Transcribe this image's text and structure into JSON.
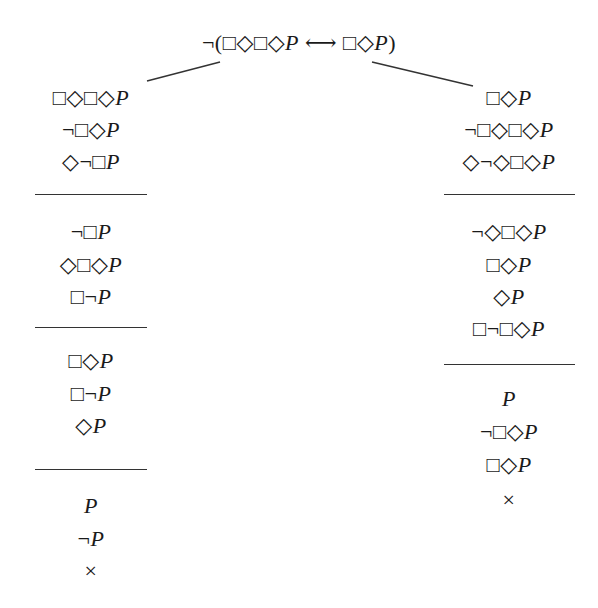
{
  "diagram": {
    "type": "modal-logic-semantic-tableau",
    "root": {
      "formula": "¬(□◇□◇P ⟷ □◇P)",
      "x": 299,
      "y": 43
    },
    "branch_lines": [
      {
        "from": [
          220,
          62
        ],
        "to": [
          147,
          81
        ]
      },
      {
        "from": [
          372,
          62
        ],
        "to": [
          473,
          86
        ]
      }
    ],
    "left_branch": {
      "center_x": 91,
      "groups": [
        {
          "rows": [
            {
              "text": "□◇□◇P",
              "y": 98
            },
            {
              "text": "¬□◇P",
              "y": 130
            },
            {
              "text": "◇¬□P",
              "y": 162
            }
          ],
          "rule_y": 194
        },
        {
          "rows": [
            {
              "text": "¬□P",
              "y": 232
            },
            {
              "text": "◇□◇P",
              "y": 265
            },
            {
              "text": "□¬P",
              "y": 297
            }
          ],
          "rule_y": 327
        },
        {
          "rows": [
            {
              "text": "□◇P",
              "y": 361
            },
            {
              "text": "□¬P",
              "y": 394
            },
            {
              "text": "◇P",
              "y": 426
            }
          ],
          "rule_y": 469
        },
        {
          "rows": [
            {
              "text": "P",
              "y": 506
            },
            {
              "text": "¬P",
              "y": 539
            },
            {
              "text": "×",
              "y": 571
            }
          ],
          "rule_y": null
        }
      ],
      "rule_x": [
        35,
        147
      ],
      "closed": true
    },
    "right_branch": {
      "center_x": 509,
      "groups": [
        {
          "rows": [
            {
              "text": "□◇P",
              "y": 98
            },
            {
              "text": "¬□◇□◇P",
              "y": 130
            },
            {
              "text": "◇¬◇□◇P",
              "y": 162
            }
          ],
          "rule_y": 194
        },
        {
          "rows": [
            {
              "text": "¬◇□◇P",
              "y": 232
            },
            {
              "text": "□◇P",
              "y": 265
            },
            {
              "text": "◇P",
              "y": 297
            },
            {
              "text": "□¬□◇P",
              "y": 329
            }
          ],
          "rule_y": 364
        },
        {
          "rows": [
            {
              "text": "P",
              "y": 399
            },
            {
              "text": "¬□◇P",
              "y": 432
            },
            {
              "text": "□◇P",
              "y": 465
            },
            {
              "text": "×",
              "y": 500
            }
          ],
          "rule_y": null
        }
      ],
      "rule_x": [
        444,
        575
      ],
      "closed": true
    },
    "closure_symbol": "×",
    "colors": {
      "ink": "#1a1a1a",
      "rule": "#333333",
      "background": "#ffffff"
    }
  }
}
